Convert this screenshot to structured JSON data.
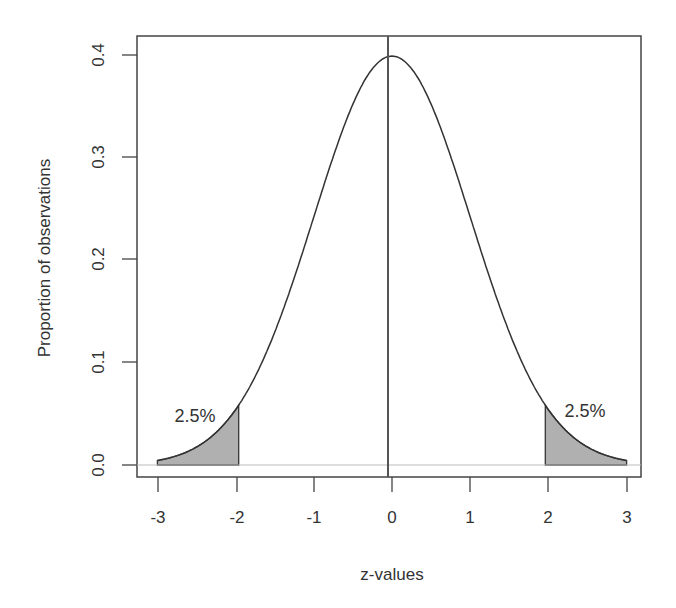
{
  "chart_data": {
    "type": "area",
    "title": "",
    "xlabel": "z-values",
    "ylabel": "Proportion of observations",
    "xlim": [
      -3,
      3
    ],
    "ylim": [
      0.0,
      0.4
    ],
    "x_ticks": [
      "-3",
      "-2",
      "-1",
      "0",
      "1",
      "2",
      "3"
    ],
    "y_ticks": [
      "0.0",
      "0.1",
      "0.2",
      "0.3",
      "0.4"
    ],
    "grid": false,
    "legend": null,
    "series": [
      {
        "name": "standard normal density",
        "x": [
          -3,
          -2.5,
          -2,
          -1.5,
          -1,
          -0.5,
          0,
          0.5,
          1,
          1.5,
          2,
          2.5,
          3
        ],
        "values": [
          0.004,
          0.018,
          0.054,
          0.13,
          0.242,
          0.352,
          0.399,
          0.352,
          0.242,
          0.13,
          0.054,
          0.018,
          0.004
        ]
      }
    ],
    "shaded_regions": [
      {
        "from": -3,
        "to": -1.96,
        "label": "2.5%",
        "color": "#b0b0b0"
      },
      {
        "from": 1.96,
        "to": 3,
        "label": "2.5%",
        "color": "#b0b0b0"
      }
    ],
    "reference_lines": [
      {
        "orientation": "vertical",
        "x": 0
      },
      {
        "orientation": "horizontal",
        "y": 0,
        "color": "#bbbbbb"
      }
    ],
    "annotations": [
      "2.5%",
      "2.5%"
    ]
  },
  "labels": {
    "xlabel": "z-values",
    "ylabel": "Proportion of observations",
    "left_tail": "2.5%",
    "right_tail": "2.5%",
    "x_ticks": [
      "-3",
      "-2",
      "-1",
      "0",
      "1",
      "2",
      "3"
    ],
    "y_ticks": [
      "0.0",
      "0.1",
      "0.2",
      "0.3",
      "0.4"
    ]
  },
  "colors": {
    "curve": "#333333",
    "shade": "#b0b0b0",
    "axis": "#333333",
    "baseline": "#bbbbbb"
  }
}
